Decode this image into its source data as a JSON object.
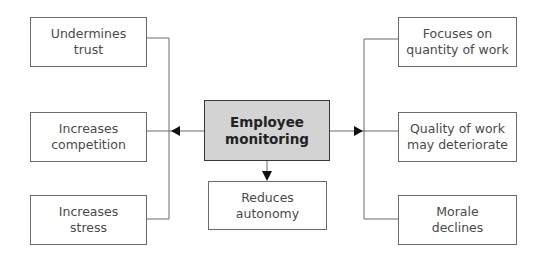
{
  "diagram": {
    "center": {
      "line1": "Employee",
      "line2": "monitoring"
    },
    "left": [
      {
        "line1": "Undermines",
        "line2": "trust"
      },
      {
        "line1": "Increases",
        "line2": "competition"
      },
      {
        "line1": "Increases",
        "line2": "stress"
      }
    ],
    "right": [
      {
        "line1": "Focuses on",
        "line2": "quantity of work"
      },
      {
        "line1": "Quality of work",
        "line2": "may deteriorate"
      },
      {
        "line1": "Morale",
        "line2": "declines"
      }
    ],
    "bottom": {
      "line1": "Reduces",
      "line2": "autonomy"
    },
    "colors": {
      "center_fill": "#d3d3d3",
      "line": "#6a6a6a",
      "arrow": "#111111"
    }
  }
}
